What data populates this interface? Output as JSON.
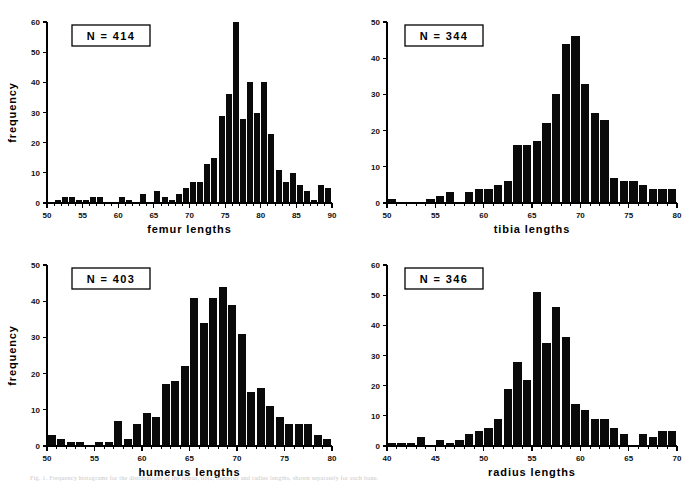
{
  "figure": {
    "caption": "Fig. 1. Frequency histograms for the distributions of the femur, tibia, humerus and radius lengths, shown separately for each bone."
  },
  "chart_data": [
    {
      "id": "femur",
      "type": "bar",
      "title": "",
      "xlabel": "femur lengths",
      "ylabel": "frequency",
      "annotation": "N  =  414",
      "n": 414,
      "xlim": [
        50,
        90
      ],
      "ylim": [
        0,
        60
      ],
      "ytick_step": 10,
      "yticks": [
        0,
        10,
        20,
        30,
        40,
        50,
        60
      ],
      "xticks": [
        50,
        55,
        60,
        65,
        70,
        75,
        80,
        85,
        90
      ],
      "xtick_minor_step": 1,
      "bin_width": 1,
      "grid": false,
      "legend": false,
      "bin_starts": [
        50,
        51,
        52,
        53,
        54,
        55,
        56,
        57,
        58,
        59,
        60,
        61,
        62,
        63,
        64,
        65,
        66,
        67,
        68,
        69,
        70,
        71,
        72,
        73,
        74,
        75,
        76,
        77,
        78,
        79,
        80,
        81,
        82,
        83,
        84,
        85,
        86,
        87,
        88,
        89
      ],
      "values": [
        0,
        1,
        2,
        2,
        1,
        1,
        2,
        2,
        0,
        0,
        2,
        1,
        0,
        3,
        0,
        4,
        2,
        1,
        3,
        5,
        7,
        7,
        13,
        15,
        29,
        36,
        60,
        28,
        40,
        30,
        40,
        23,
        11,
        7,
        10,
        6,
        4,
        1,
        6,
        5
      ]
    },
    {
      "id": "tibia",
      "type": "bar",
      "title": "",
      "xlabel": "tibia lengths",
      "ylabel": "",
      "annotation": "N  =  344",
      "n": 344,
      "xlim": [
        50,
        80
      ],
      "ylim": [
        0,
        50
      ],
      "ytick_step": 10,
      "yticks": [
        0,
        10,
        20,
        30,
        40,
        50
      ],
      "xticks": [
        50,
        55,
        60,
        65,
        70,
        75,
        80
      ],
      "xtick_minor_step": 1,
      "bin_width": 1,
      "grid": false,
      "legend": false,
      "bin_starts": [
        50,
        51,
        52,
        53,
        54,
        55,
        56,
        57,
        58,
        59,
        60,
        61,
        62,
        63,
        64,
        65,
        66,
        67,
        68,
        69,
        70,
        71,
        72,
        73,
        74,
        75,
        76,
        77,
        78,
        79
      ],
      "values": [
        1,
        0,
        0,
        0,
        1,
        2,
        3,
        0,
        3,
        4,
        4,
        5,
        6,
        16,
        16,
        17,
        22,
        30,
        44,
        46,
        33,
        25,
        23,
        7,
        6,
        6,
        5,
        4,
        4,
        4
      ]
    },
    {
      "id": "humerus",
      "type": "bar",
      "title": "",
      "xlabel": "humerus lengths",
      "ylabel": "frequency",
      "annotation": "N  =  403",
      "n": 403,
      "xlim": [
        50,
        80
      ],
      "ylim": [
        0,
        50
      ],
      "ytick_step": 10,
      "yticks": [
        0,
        10,
        20,
        30,
        40,
        50
      ],
      "xticks": [
        50,
        55,
        60,
        65,
        70,
        75,
        80
      ],
      "xtick_minor_step": 1,
      "bin_width": 1,
      "grid": false,
      "legend": false,
      "bin_starts": [
        50,
        51,
        52,
        53,
        54,
        55,
        56,
        57,
        58,
        59,
        60,
        61,
        62,
        63,
        64,
        65,
        66,
        67,
        68,
        69,
        70,
        71,
        72,
        73,
        74,
        75,
        76,
        77,
        78,
        79
      ],
      "values": [
        3,
        2,
        1,
        1,
        0,
        1,
        1,
        7,
        2,
        6,
        9,
        8,
        17,
        18,
        22,
        41,
        34,
        41,
        44,
        39,
        31,
        15,
        16,
        11,
        8,
        6,
        6,
        6,
        3,
        2
      ]
    },
    {
      "id": "radius",
      "type": "bar",
      "title": "",
      "xlabel": "radius lengths",
      "ylabel": "",
      "annotation": "N  =  346",
      "n": 346,
      "xlim": [
        40,
        70
      ],
      "ylim": [
        0,
        60
      ],
      "ytick_step": 10,
      "yticks": [
        0,
        10,
        20,
        30,
        40,
        50,
        60
      ],
      "xticks": [
        40,
        45,
        50,
        55,
        60,
        65,
        70
      ],
      "xtick_minor_step": 1,
      "bin_width": 1,
      "grid": false,
      "legend": false,
      "bin_starts": [
        40,
        41,
        42,
        43,
        44,
        45,
        46,
        47,
        48,
        49,
        50,
        51,
        52,
        53,
        54,
        55,
        56,
        57,
        58,
        59,
        60,
        61,
        62,
        63,
        64,
        65,
        66,
        67,
        68,
        69
      ],
      "values": [
        1,
        1,
        1,
        3,
        0,
        2,
        1,
        2,
        4,
        5,
        6,
        9,
        19,
        28,
        22,
        51,
        34,
        46,
        36,
        14,
        12,
        9,
        9,
        6,
        4,
        0,
        4,
        3,
        5,
        5
      ]
    }
  ]
}
